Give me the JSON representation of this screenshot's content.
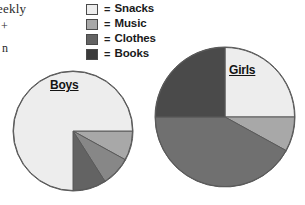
{
  "margin_text": {
    "line1": "eekly",
    "line2": "+",
    "line3": "n"
  },
  "legend": {
    "equals_sign": "=",
    "items": [
      {
        "label": "Snacks",
        "color": "#ededed",
        "swatch_name": "legend-swatch-snacks"
      },
      {
        "label": "Music",
        "color": "#a8a8a8",
        "swatch_name": "legend-swatch-music"
      },
      {
        "label": "Clothes",
        "color": "#636363",
        "swatch_name": "legend-swatch-clothes"
      },
      {
        "label": "Books",
        "color": "#3a3a3a",
        "swatch_name": "legend-swatch-books"
      }
    ]
  },
  "chart_data": [
    {
      "type": "pie",
      "title": "Boys",
      "id": "boys",
      "center": [
        73,
        131
      ],
      "radius": 60,
      "start_angle_deg": 0,
      "direction": "clockwise",
      "outline_color": "#5a5a5a",
      "categories": [
        "Music",
        "Clothes",
        "Books",
        "Snacks"
      ],
      "values": [
        8,
        8,
        9,
        75
      ],
      "slices": [
        {
          "label": "Music",
          "percent": 8,
          "color": "#a8a8a8"
        },
        {
          "label": "Clothes",
          "percent": 8,
          "color": "#878787"
        },
        {
          "label": "Books",
          "percent": 9,
          "color": "#636363"
        },
        {
          "label": "Snacks",
          "percent": 75,
          "color": "#ededed"
        }
      ],
      "legend_position": "top-center",
      "grid": false,
      "xlabel": "",
      "ylabel": ""
    },
    {
      "type": "pie",
      "title": "Girls",
      "id": "girls",
      "center": [
        225,
        117
      ],
      "radius": 70,
      "start_angle_deg": -90,
      "direction": "clockwise",
      "outline_color": "#5a5a5a",
      "categories": [
        "Snacks",
        "Music",
        "Clothes",
        "Books"
      ],
      "values": [
        25,
        8,
        42,
        25
      ],
      "slices": [
        {
          "label": "Snacks",
          "percent": 25,
          "color": "#ededed"
        },
        {
          "label": "Music",
          "percent": 8,
          "color": "#a8a8a8"
        },
        {
          "label": "Clothes",
          "percent": 42,
          "color": "#707070"
        },
        {
          "label": "Books",
          "percent": 25,
          "color": "#4a4a4a"
        }
      ],
      "legend_position": "top-center",
      "grid": false,
      "xlabel": "",
      "ylabel": ""
    }
  ]
}
